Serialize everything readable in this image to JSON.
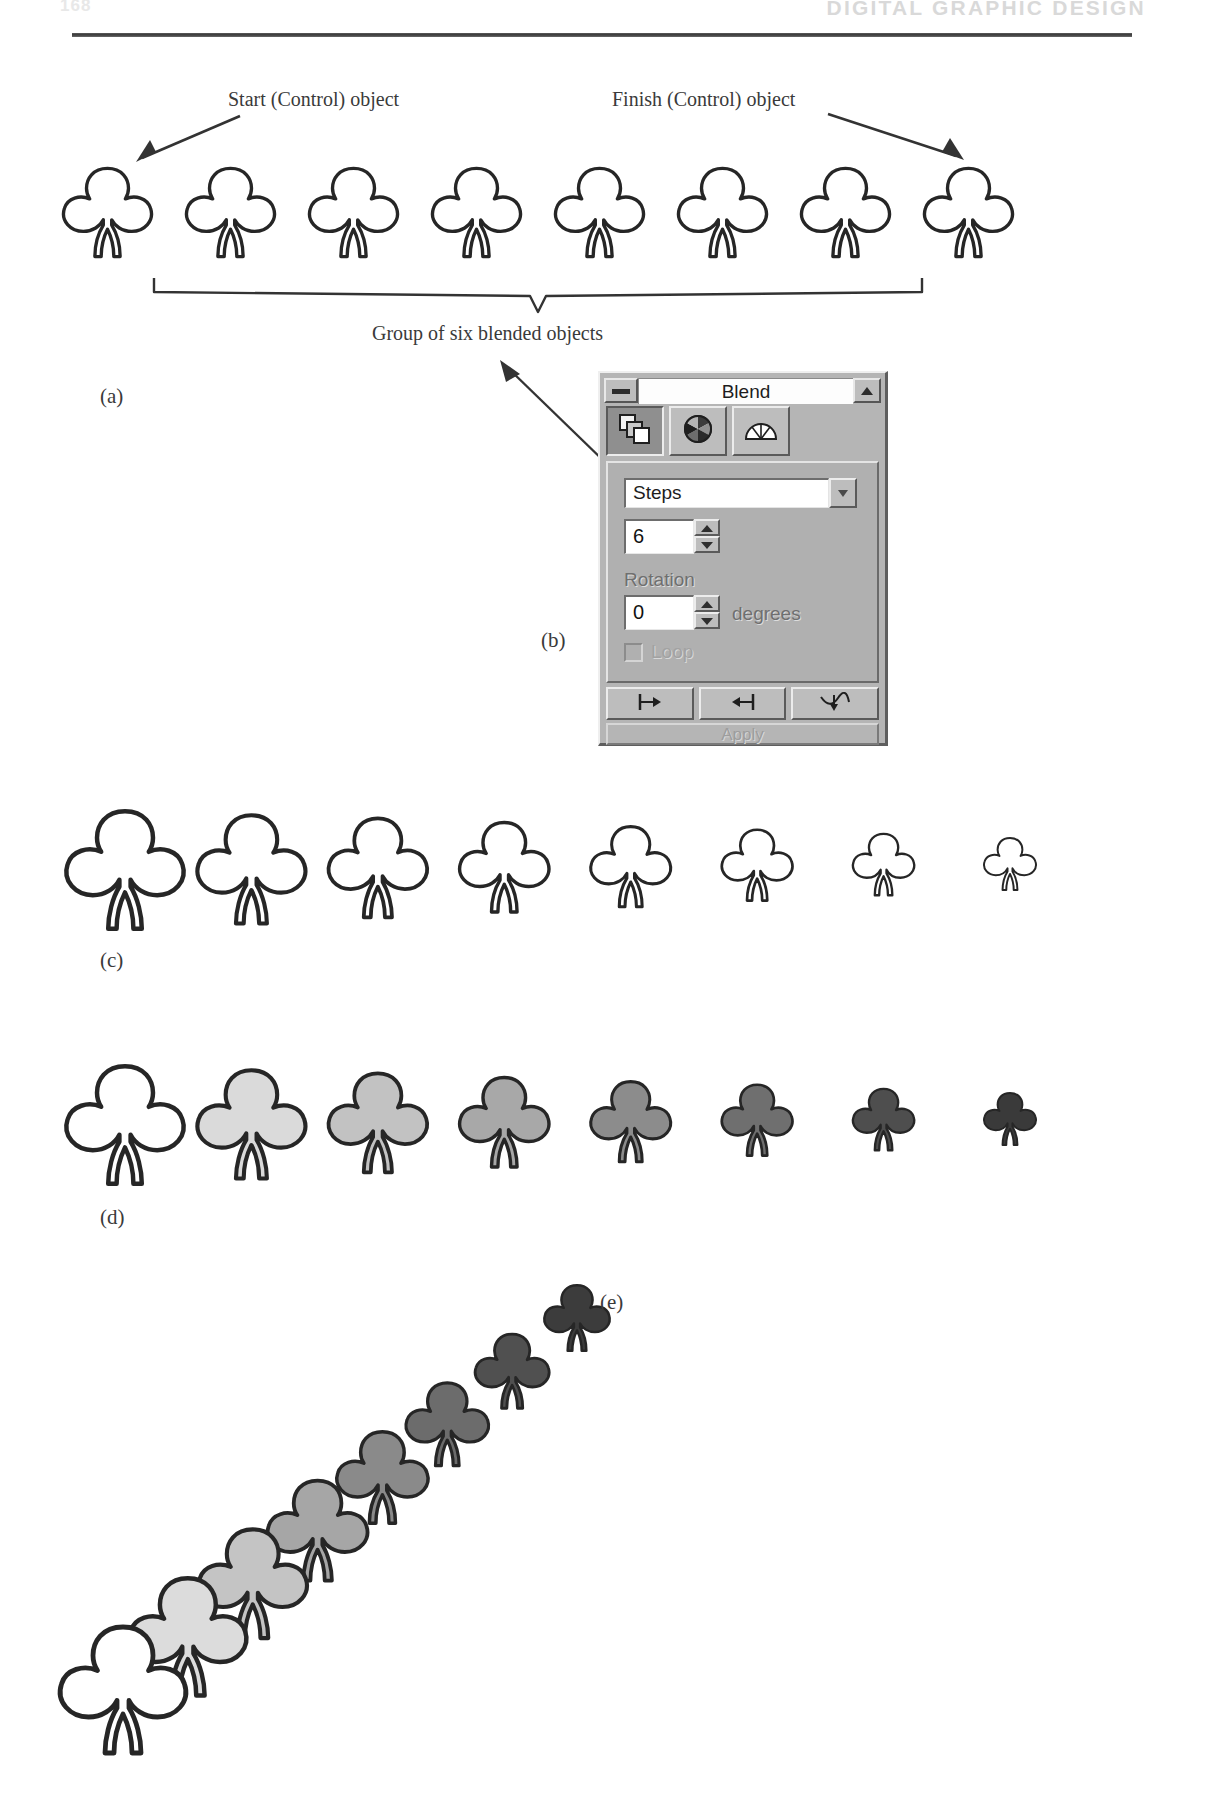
{
  "page": {
    "folio": "168",
    "running_head": "DIGITAL GRAPHIC DESIGN"
  },
  "figure": {
    "panel_a": {
      "letter": "(a)",
      "start_label": "Start (Control) object",
      "finish_label": "Finish (Control) object",
      "brace_label": "Group of six blended objects",
      "object_count": 8,
      "blended_count": 6
    },
    "panel_b": {
      "letter": "(b)"
    },
    "panel_c": {
      "letter": "(c)",
      "object_count": 8
    },
    "panel_d": {
      "letter": "(d)",
      "object_count": 8
    },
    "panel_e": {
      "letter": "(e)",
      "object_count": 8
    }
  },
  "dialog": {
    "title": "Blend",
    "system_menu_icon": "window-menu-icon",
    "maximize_icon": "maximize-triangle-icon",
    "tabs": [
      {
        "name": "steps-tab",
        "icon": "stacked-pages-icon",
        "active": true
      },
      {
        "name": "color-tab",
        "icon": "color-wheel-icon",
        "active": false
      },
      {
        "name": "acceleration-tab",
        "icon": "fan-gauge-icon",
        "active": false
      }
    ],
    "mode_select": {
      "value": "Steps",
      "options": [
        "Steps",
        "Spacing"
      ],
      "arrow_icon": "chevron-down-icon"
    },
    "steps": {
      "value": "6",
      "spinner_up_icon": "spinner-up-icon",
      "spinner_down_icon": "spinner-down-icon"
    },
    "rotation": {
      "label": "Rotation",
      "value": "0",
      "unit": "degrees",
      "spinner_up_icon": "spinner-up-icon",
      "spinner_down_icon": "spinner-down-icon"
    },
    "loop": {
      "label": "Loop",
      "checked": false,
      "enabled": false
    },
    "buttons": [
      {
        "name": "start-object-button",
        "icon": "start-marker-icon"
      },
      {
        "name": "end-object-button",
        "icon": "end-marker-icon"
      },
      {
        "name": "path-button",
        "icon": "blend-path-icon"
      }
    ],
    "apply_button": {
      "label": "Apply",
      "enabled": false
    }
  },
  "shamrock_fills": {
    "row_c": [
      "#ffffff",
      "#ffffff",
      "#ffffff",
      "#ffffff",
      "#ffffff",
      "#ffffff",
      "#ffffff",
      "#ffffff"
    ],
    "row_d": [
      "#ffffff",
      "#dadada",
      "#c2c2c2",
      "#a8a8a8",
      "#8c8c8c",
      "#6f6f6f",
      "#4e4e4e",
      "#3a3a3a"
    ],
    "row_e": [
      "#ffffff",
      "#dcdcdc",
      "#c4c4c4",
      "#a6a6a6",
      "#8a8a8a",
      "#6c6c6c",
      "#505050",
      "#3c3c3c"
    ]
  }
}
